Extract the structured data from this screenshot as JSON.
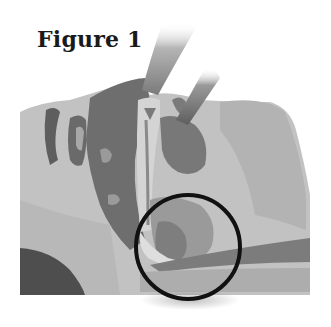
{
  "figure": {
    "title": "Figure 1",
    "colors": {
      "background": "#ffffff",
      "skin_light": "#c4c4c4",
      "skin_mid": "#a8a8a8",
      "tissue_dark": "#6e6e6e",
      "tissue_darker": "#555555",
      "tube": "#8a8a8a",
      "highlight_circle": "#111111",
      "title_text": "#1a1a1a"
    },
    "highlight": {
      "shape": "circle",
      "cx": 188,
      "cy": 247,
      "r": 52
    }
  }
}
